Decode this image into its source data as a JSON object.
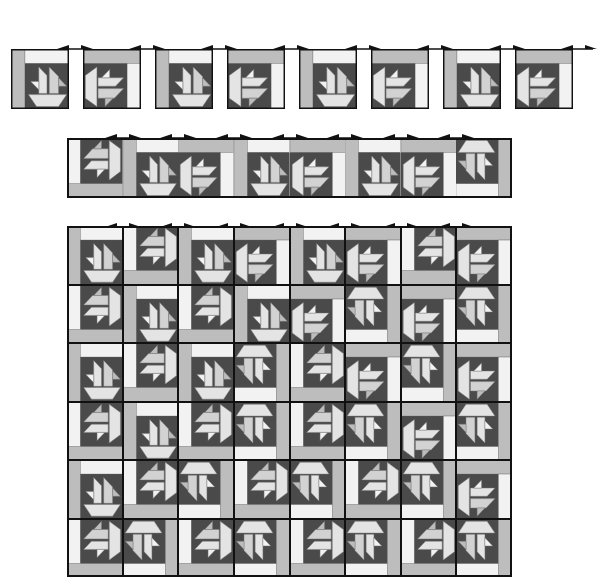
{
  "colors": {
    "dark": "#4a4a4a",
    "light": "#e4e4e4",
    "lighter": "#f2f2f2",
    "medium": "#bdbdbd",
    "mediumlight": "#d2d2d2",
    "outline": "#111111",
    "seam": "#7a7a7a"
  },
  "pressing_arrow": {
    "icon": "pressing-direction-arrow-icon",
    "meaning": "press seams in alternating directions"
  },
  "step1_blocks": {
    "label": "individual blocks",
    "x": 11,
    "y": 49,
    "w": 58,
    "h": 60,
    "pitch": 72,
    "arrow_y": 38,
    "blocks": [
      {
        "rot": 0,
        "strips": "LT"
      },
      {
        "rot": 90,
        "strips": "TR"
      },
      {
        "rot": 0,
        "strips": "LT"
      },
      {
        "rot": 90,
        "strips": "TR"
      },
      {
        "rot": 0,
        "strips": "LT"
      },
      {
        "rot": 90,
        "strips": "TR"
      },
      {
        "rot": 0,
        "strips": "LT"
      },
      {
        "rot": 90,
        "strips": "TR"
      }
    ]
  },
  "step2_row": {
    "label": "blocks joined into a row",
    "x": 67,
    "y": 138,
    "w": 445,
    "h": 60,
    "cols": 8,
    "arrow_y": 127,
    "blocks": [
      {
        "rot": 270,
        "strips": "LB"
      },
      {
        "rot": 0,
        "strips": "LT"
      },
      {
        "rot": 90,
        "strips": "TR"
      },
      {
        "rot": 0,
        "strips": "LT"
      },
      {
        "rot": 90,
        "strips": "TR"
      },
      {
        "rot": 0,
        "strips": "LT"
      },
      {
        "rot": 90,
        "strips": "TR"
      },
      {
        "rot": 180,
        "strips": "BR"
      }
    ]
  },
  "step3_quilt": {
    "label": "rows joined into quilt top",
    "x": 67,
    "y": 226,
    "w": 445,
    "h": 351,
    "cols": 8,
    "rows": 6,
    "arrow_y": 216,
    "blocks": [
      [
        {
          "rot": 0,
          "strips": "LT"
        },
        {
          "rot": 270,
          "strips": "LB"
        },
        {
          "rot": 0,
          "strips": "LT"
        },
        {
          "rot": 90,
          "strips": "TR"
        },
        {
          "rot": 0,
          "strips": "LT"
        },
        {
          "rot": 90,
          "strips": "TR"
        },
        {
          "rot": 270,
          "strips": "LB"
        },
        {
          "rot": 90,
          "strips": "TR"
        }
      ],
      [
        {
          "rot": 270,
          "strips": "LB"
        },
        {
          "rot": 0,
          "strips": "LT"
        },
        {
          "rot": 270,
          "strips": "LB"
        },
        {
          "rot": 0,
          "strips": "LT"
        },
        {
          "rot": 90,
          "strips": "TR"
        },
        {
          "rot": 180,
          "strips": "BR"
        },
        {
          "rot": 90,
          "strips": "TR"
        },
        {
          "rot": 180,
          "strips": "BR"
        }
      ],
      [
        {
          "rot": 0,
          "strips": "LT"
        },
        {
          "rot": 270,
          "strips": "LB"
        },
        {
          "rot": 0,
          "strips": "LT"
        },
        {
          "rot": 180,
          "strips": "BR"
        },
        {
          "rot": 270,
          "strips": "LB"
        },
        {
          "rot": 90,
          "strips": "TR"
        },
        {
          "rot": 180,
          "strips": "BR"
        },
        {
          "rot": 90,
          "strips": "TR"
        }
      ],
      [
        {
          "rot": 270,
          "strips": "LB"
        },
        {
          "rot": 0,
          "strips": "LT"
        },
        {
          "rot": 270,
          "strips": "LB"
        },
        {
          "rot": 180,
          "strips": "BR"
        },
        {
          "rot": 270,
          "strips": "LB"
        },
        {
          "rot": 180,
          "strips": "BR"
        },
        {
          "rot": 90,
          "strips": "TR"
        },
        {
          "rot": 180,
          "strips": "BR"
        }
      ],
      [
        {
          "rot": 0,
          "strips": "LT"
        },
        {
          "rot": 270,
          "strips": "LB"
        },
        {
          "rot": 180,
          "strips": "BR"
        },
        {
          "rot": 270,
          "strips": "LB"
        },
        {
          "rot": 180,
          "strips": "BR"
        },
        {
          "rot": 270,
          "strips": "LB"
        },
        {
          "rot": 180,
          "strips": "BR"
        },
        {
          "rot": 90,
          "strips": "TR"
        }
      ],
      [
        {
          "rot": 270,
          "strips": "LB"
        },
        {
          "rot": 180,
          "strips": "BR"
        },
        {
          "rot": 270,
          "strips": "LB"
        },
        {
          "rot": 180,
          "strips": "BR"
        },
        {
          "rot": 270,
          "strips": "LB"
        },
        {
          "rot": 180,
          "strips": "BR"
        },
        {
          "rot": 270,
          "strips": "LB"
        },
        {
          "rot": 180,
          "strips": "BR"
        }
      ]
    ]
  }
}
